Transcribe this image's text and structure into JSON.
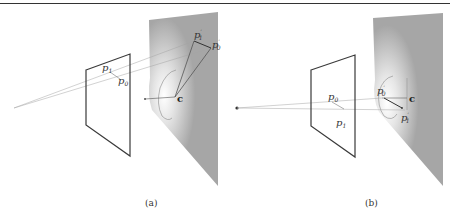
{
  "figure": {
    "panels": [
      {
        "id": "a",
        "caption": "(a)",
        "labels": {
          "p1": "p",
          "p1_sub": "1",
          "p0": "p",
          "p0_sub": "0",
          "p1_prime": "p",
          "p1_prime_sub": "1",
          "p0_prime": "p",
          "p0_prime_sub": "0",
          "prime": "′",
          "center": "c"
        }
      },
      {
        "id": "b",
        "caption": "(b)",
        "labels": {
          "p0": "p",
          "p0_sub": "0",
          "p1": "p",
          "p1_sub": "1",
          "p0_prime": "p",
          "p0_prime_sub": "0",
          "p1_prime": "p",
          "p1_prime_sub": "1",
          "prime": "′",
          "center": "c"
        }
      }
    ],
    "colors": {
      "frame_stroke": "#444444",
      "ray_stroke": "#9a9a9a",
      "surface_fill": "#a8a8a8",
      "highlight": "#ffffff"
    }
  }
}
